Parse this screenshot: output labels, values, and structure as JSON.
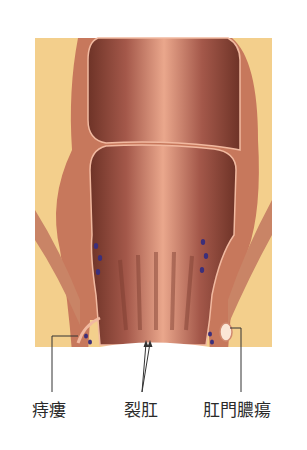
{
  "diagram": {
    "type": "anatomical-illustration",
    "colors": {
      "background": "#ffffff",
      "fat_tissue": "#f3cf8c",
      "muscle_wall": "#c7785c",
      "lumen_dark": "#7a3b2e",
      "lumen_light": "#e9a58a",
      "vessels": "#3c2f7a",
      "leader_lines": "#333333"
    },
    "labels": [
      {
        "id": "fistula",
        "text": "痔瘻"
      },
      {
        "id": "fissure",
        "text": "裂肛"
      },
      {
        "id": "abscess",
        "text": "肛門膿瘍"
      }
    ]
  }
}
